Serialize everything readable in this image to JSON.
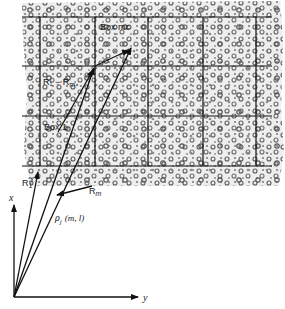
{
  "figure": {
    "type": "diagram",
    "grid": {
      "rows": 3,
      "cols": 4,
      "h_lines_y": [
        17,
        66,
        116,
        166
      ],
      "v_lines_x": [
        40,
        95,
        148,
        203,
        256
      ]
    },
    "labels": {
      "box_mc": "Box mc",
      "box_1": "Box 1",
      "r1_minus_rm": "R₁ − R",
      "r1_minus_rm_sub": "m",
      "r1": "R",
      "r1_sub": "1",
      "rm": "R",
      "rm_sub": "m",
      "rho": "ρ",
      "rho_sub": "j",
      "rho_args": "(m, l)",
      "axis_x": "x",
      "axis_y": "y"
    },
    "colors": {
      "line": "#111111",
      "tissue_bg": "#e6e6e6",
      "cell": "#6a6a6a"
    }
  }
}
